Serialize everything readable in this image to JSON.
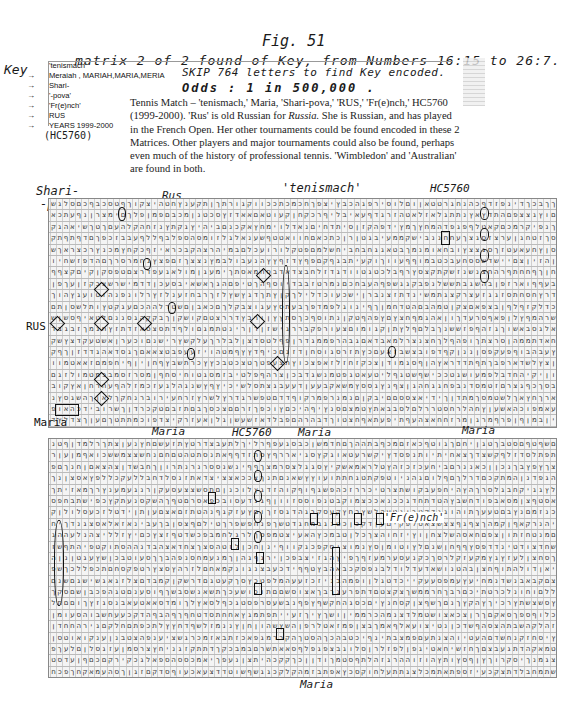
{
  "figure": {
    "title": "Fig. 51",
    "heading": "matrix 2 of 2 found of Key, from Numbers 16:15 to 26:7.",
    "skip_note": "SKIP 764 letters to find Key encoded.",
    "odds_note": "Odds : 1 in 500,000 ."
  },
  "key": {
    "label": "Key",
    "items": [
      {
        "arrow": "",
        "text": "'tenismach'"
      },
      {
        "arrow": "→",
        "text": "Meraiah , MARIAH,MARIA,MERIA"
      },
      {
        "arrow": "→",
        "text": "Shari-"
      },
      {
        "arrow": "→",
        "text": "'-pova'"
      },
      {
        "arrow": "→",
        "text": "'Fr(e)nch'"
      },
      {
        "arrow": "→",
        "text": "RUS"
      },
      {
        "arrow": "→",
        "text": "YEARS 1999-2000"
      }
    ],
    "handwritten_note": "(HC5760)"
  },
  "paragraph": {
    "text_1": "Tennis Match – 'tenismach,' Maria, 'Shari-pova,' 'RUS,' 'Fr(e)nch,' HC5760 (1999-2000). 'Rus' is old Russian for ",
    "italic": "Russia.",
    "text_2": " She is Russian, and has played in the French Open. Her other tournaments could be found encoded in these 2 Matrices. Other players and major tournaments could also be found, perhaps even much of the history of professional tennis. 'Wimbledon' and 'Australian' are found in both."
  },
  "annotations": {
    "top_matrix": {
      "shari": "Shari-",
      "pova": "-pova-",
      "rus": "Rus",
      "tenismach": "'tenismach'",
      "hc5760": "HC5760",
      "rus_vertical": "RUS"
    },
    "between": {
      "maria_vertical": "Maria",
      "maria_1": "Maria",
      "hc5760": "HC5760",
      "maria_2": "Maria",
      "maria_3": "Maria"
    },
    "bottom_matrix": {
      "french": "'Fr(e)nch'",
      "maria_bottom": "Maria"
    }
  },
  "matrices": {
    "letters": "אבגדהוזחטיכלמנסעפצקרשתםןךףץ",
    "top": {
      "rows": 22,
      "cols": 80,
      "seed": 17
    },
    "bottom": {
      "rows": 23,
      "cols": 80,
      "seed": 91
    }
  }
}
